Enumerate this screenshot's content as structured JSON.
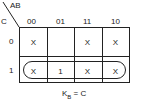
{
  "kmap": {
    "corner_top": "AB",
    "corner_left": "C",
    "columns": [
      "00",
      "01",
      "11",
      "10"
    ],
    "rows": [
      "0",
      "1"
    ],
    "cells": [
      [
        "X",
        "",
        "X",
        "X"
      ],
      [
        "X",
        "1",
        "X",
        "X"
      ]
    ],
    "grouping": "row C=1 (all four cells)",
    "caption_main": "K",
    "caption_sub": "B",
    "caption_rest": " = C"
  }
}
